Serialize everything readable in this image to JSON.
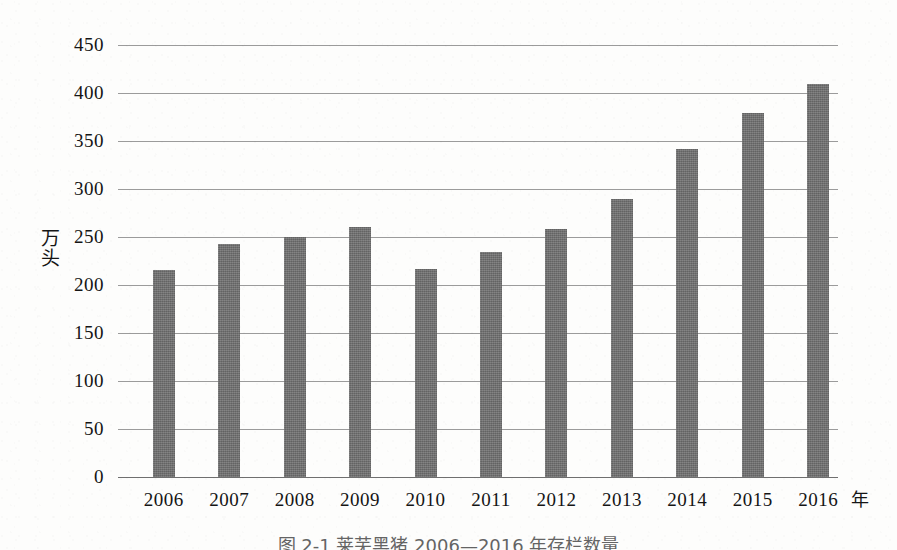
{
  "chart_data": {
    "type": "bar",
    "title": "",
    "categories": [
      "2006",
      "2007",
      "2008",
      "2009",
      "2010",
      "2011",
      "2012",
      "2013",
      "2014",
      "2015",
      "2016"
    ],
    "values": [
      216,
      243,
      250,
      260,
      217,
      234,
      258,
      290,
      342,
      379,
      409
    ],
    "series": [
      {
        "name": "存栏数量",
        "values": [
          216,
          243,
          250,
          260,
          217,
          234,
          258,
          290,
          342,
          379,
          409
        ]
      }
    ],
    "xlabel": "年",
    "ylabel": "万头",
    "ylim": [
      0,
      450
    ],
    "ytick_step": 50,
    "yticks": [
      "450",
      "400",
      "350",
      "300",
      "250",
      "200",
      "150",
      "100",
      "50",
      "0"
    ],
    "ytick_values": [
      450,
      400,
      350,
      300,
      250,
      200,
      150,
      100,
      50,
      0
    ],
    "grid": true,
    "grid_axis": "y",
    "legend": false,
    "legend_position": "none",
    "bar_color": "#6c6c6c",
    "grid_color": "#9b9b9b",
    "axis_color": "#6f6f6f",
    "background_color": "#fdfdfc"
  },
  "axes": {
    "y_title_chars": [
      "万",
      "头"
    ],
    "x_unit": "年"
  },
  "caption": {
    "text": "图 2-1  莱芜黑猪 2006—2016 年存栏数量"
  }
}
